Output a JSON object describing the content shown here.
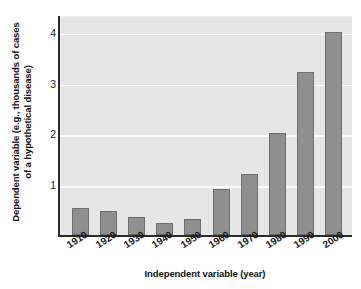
{
  "chart_data": {
    "type": "bar",
    "title": "",
    "xlabel": "Independent variable (year)",
    "ylabel": "Dependent variable (e.g., thousands of cases of a hypothetical disease)",
    "categories": [
      "1910",
      "1920",
      "1930",
      "1940",
      "1950",
      "1960",
      "1970",
      "1980",
      "1990",
      "2000"
    ],
    "values": [
      0.53,
      0.48,
      0.36,
      0.24,
      0.31,
      0.9,
      1.2,
      2.0,
      3.2,
      4.0
    ],
    "ylim": [
      0,
      4.35
    ],
    "yticks": [
      "1",
      "2",
      "3",
      "4"
    ],
    "ytick_values": [
      1,
      2,
      3,
      4
    ],
    "grid": true,
    "legend": "none",
    "colors": {
      "bar_fill": "#8f8f8f",
      "bar_border": "#6d6d6d",
      "plot_background": "#e6e6e6",
      "gridline": "#fafafa",
      "axis": "#2b2b2b",
      "text": "#111111"
    }
  }
}
